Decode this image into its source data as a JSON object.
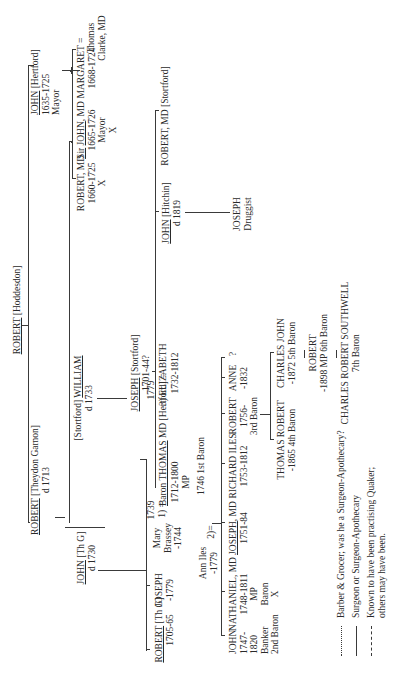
{
  "diagram": {
    "type": "family-tree",
    "orientation": "rotated 90 degrees counter-clockwise",
    "root": {
      "name": "ROBERT",
      "place": "[Hoddesdon]"
    },
    "people": {
      "robert_hoddesdon": {
        "name": "ROBERT",
        "detail": "[Hoddesdon]"
      },
      "john_hertford": {
        "name": "JOHN",
        "detail": "[Hertford]",
        "dates": "1635-1725",
        "note": "Mayor"
      },
      "robert_md_1660": {
        "name": "ROBERT, MD",
        "dates": "1660-1725",
        "mark": "X"
      },
      "sir_john_md": {
        "prefix": "Sir",
        "name": "JOHN",
        "suffix": ", MD",
        "dates": "1665-1726",
        "note": "Mayor",
        "mark": "X"
      },
      "margaret": {
        "name": "MARGARET =",
        "dates": "1668-1724"
      },
      "thomas_clarke": {
        "line1": "Thomas",
        "line2": "Clarke, MD"
      },
      "robert_theydon": {
        "name": "ROBERT",
        "detail": "[Theydon Garnon]",
        "dates": "d 1713"
      },
      "william_stortford": {
        "prefix": "[Stortford]",
        "name": "WILLIAM",
        "dates": "d 1733"
      },
      "joseph_stortford": {
        "name": "JOSEPH",
        "detail": "[Stortford]",
        "dates": "1701-44?"
      },
      "john_hitchin": {
        "name": "JOHN",
        "detail": "[Hitchin]",
        "dates": "d 1819"
      },
      "robert_md_stortford": {
        "name": "ROBERT, MD [Stortford]"
      },
      "joseph_druggist": {
        "name": "JOSEPH",
        "note": "Druggist"
      },
      "john_thg": {
        "name": "JOHN",
        "detail": "[Th G]",
        "dates": "d 1730"
      },
      "robert_thg": {
        "name": "ROBERT",
        "detail": "[Th G]",
        "dates": "1705-65"
      },
      "joseph_1779": {
        "name": "JOSEPH",
        "dates": "-1779"
      },
      "mary_brassey": {
        "line1": "Mary",
        "line2": "Brassey",
        "dates": "-1744",
        "marriage": "1739",
        "marker": "1) ="
      },
      "baron_thomas": {
        "name": "Baron THOMAS",
        "suffix": "MD [Hertford] =",
        "dates": "1712-1800",
        "note1": "MP",
        "note2": "1746 1st Baron"
      },
      "ann_iles": {
        "name": "Ann Iles",
        "dates": "-1779",
        "marker": "2)="
      },
      "elizabeth": {
        "name": "ELIZABETH",
        "dates": "1732-1812",
        "marriage": "1779",
        "marker": "3)"
      },
      "john_1747": {
        "lines": [
          "JOHN",
          "1747-",
          "1820",
          "Banker",
          "2nd Baron"
        ]
      },
      "nathaniel_md": {
        "name": "NATHANIEL, MD",
        "dates": "1748-1811",
        "note1": "MP",
        "note2": "Baron",
        "mark": "X"
      },
      "joseph_md": {
        "name": "JOSEPH",
        "suffix": ", MD",
        "dates": "1751-84"
      },
      "richard_iles": {
        "name": "RICHARD ILES",
        "dates": "1753-1812"
      },
      "robert_3rd": {
        "name": "ROBERT",
        "dates": "1756-",
        "note": "3rd Baron"
      },
      "anne": {
        "name": "ANNE",
        "dates": "-1832"
      },
      "unknown": {
        "name": "?"
      },
      "thomas_robert": {
        "name": "THOMAS ROBERT",
        "dates": "-1865 4th Baron"
      },
      "charles_john": {
        "name": "CHARLES JOHN",
        "dates": "-1872 5th Baron"
      },
      "robert_6th": {
        "name": "ROBERT",
        "dates": "-1898 MP 6th Baron"
      },
      "charles_robert_southwell": {
        "name": "CHARLES ROBERT SOUTHWELL",
        "note": "7th Baron"
      }
    }
  },
  "legend": {
    "items": [
      {
        "style": "dotted",
        "label": "Barber & Grocer; was he a Surgeon-Apothecary?"
      },
      {
        "style": "solid",
        "label": "Surgeon or Surgeon-Apothecary"
      },
      {
        "style": "dashed",
        "label": "Known to have been practising Quaker;",
        "label2": "others may have been."
      }
    ]
  }
}
